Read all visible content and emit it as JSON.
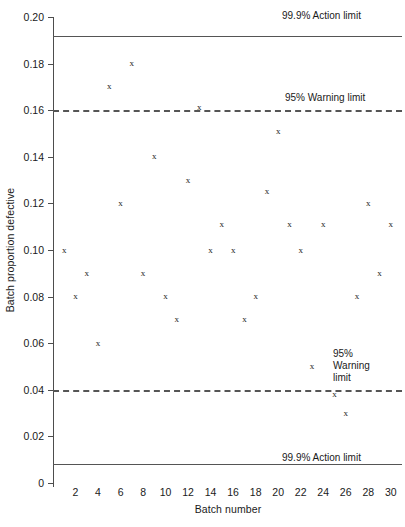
{
  "chart_data": {
    "type": "scatter",
    "title": "",
    "xlabel": "Batch number",
    "ylabel": "Batch proportion defective",
    "xlim": [
      0,
      31
    ],
    "ylim": [
      0,
      0.2
    ],
    "grid": false,
    "marker": "x",
    "x": [
      1,
      2,
      3,
      4,
      5,
      6,
      7,
      8,
      9,
      10,
      11,
      12,
      13,
      14,
      15,
      16,
      17,
      18,
      19,
      20,
      21,
      22,
      23,
      24,
      25,
      26,
      27,
      28,
      29,
      30
    ],
    "y": [
      0.1,
      0.08,
      0.09,
      0.06,
      0.17,
      0.12,
      0.18,
      0.09,
      0.14,
      0.08,
      0.07,
      0.13,
      0.161,
      0.1,
      0.111,
      0.1,
      0.07,
      0.08,
      0.125,
      0.151,
      0.111,
      0.1,
      0.05,
      0.111,
      0.038,
      0.03,
      0.08,
      0.12,
      0.09,
      0.111
    ],
    "xticks": [
      2,
      4,
      6,
      8,
      10,
      12,
      14,
      16,
      18,
      20,
      22,
      24,
      26,
      28,
      30
    ],
    "ytick_labels": [
      "0.20",
      "0.18",
      "0.16",
      "0.14",
      "0.12",
      "0.10",
      "0.08",
      "0.06",
      "0.04",
      "0.02",
      "0"
    ],
    "ytick_values": [
      0.2,
      0.18,
      0.16,
      0.14,
      0.12,
      0.1,
      0.08,
      0.06,
      0.04,
      0.02,
      0
    ],
    "reference_lines": [
      {
        "id": "upper-action",
        "value": 0.192,
        "style": "solid",
        "label": "99.9% Action limit"
      },
      {
        "id": "upper-warning",
        "value": 0.16,
        "style": "dashed",
        "label": "95% Warning limit"
      },
      {
        "id": "lower-warning",
        "value": 0.04,
        "style": "dashed",
        "label": "95%\nWarning\nlimit"
      },
      {
        "id": "lower-action",
        "value": 0.008,
        "style": "solid",
        "label": "99.9% Action limit"
      }
    ]
  },
  "labels": {
    "upper_action": "99.9% Action limit",
    "upper_warning": "95% Warning limit",
    "lower_warning": "95%\nWarning\nlimit",
    "lower_action": "99.9% Action limit",
    "x_axis_title": "Batch number",
    "y_axis_title": "Batch proportion defective"
  },
  "colors": {
    "axis": "#4d4d4d",
    "limit_line": "#555555",
    "marker": "#262626",
    "background": "#ffffff"
  }
}
